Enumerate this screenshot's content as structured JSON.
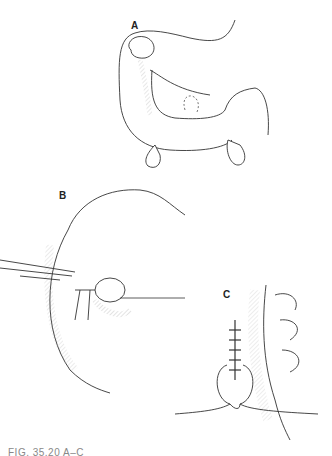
{
  "figure": {
    "panels": [
      {
        "label": "A",
        "description": "Bowel loop with three small outpouchings (diverticula)"
      },
      {
        "label": "B",
        "description": "Diverticulum grasped and clamped with forceps, needle passing through"
      },
      {
        "label": "C",
        "description": "Sutured closure of bowel wall with knotted thread"
      }
    ],
    "caption": "FIG. 35.20  A–C"
  }
}
